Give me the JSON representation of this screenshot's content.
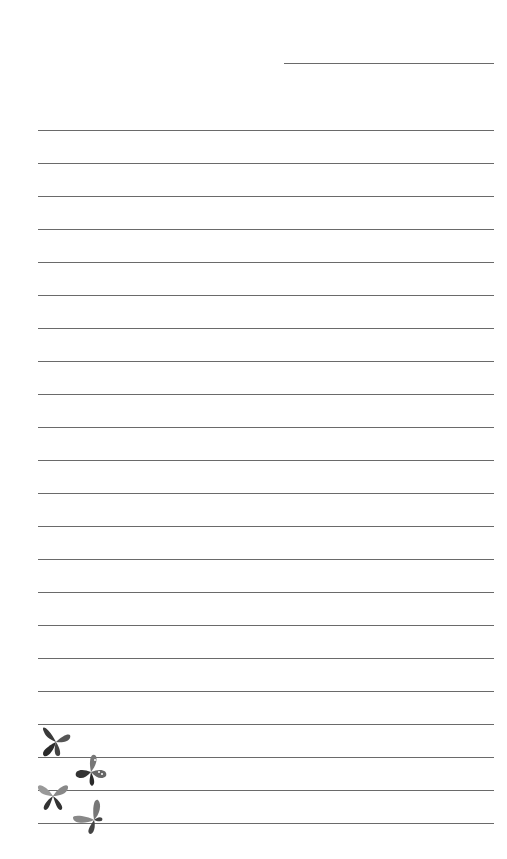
{
  "page": {
    "type": "lined-stationery",
    "background": "#ffffff",
    "line_color": "#6a6a6a",
    "date_line": {
      "present": true
    },
    "ruled_lines": {
      "count": 22,
      "first_y": 130,
      "spacing": 33
    },
    "decoration": {
      "icon": "butterfly-icon",
      "count": 4,
      "color": "grayscale"
    }
  }
}
